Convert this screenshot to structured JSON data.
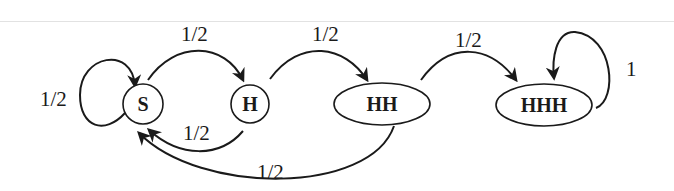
{
  "diagram": {
    "type": "state-transition",
    "nodes": [
      {
        "id": "S",
        "label": "S"
      },
      {
        "id": "H",
        "label": "H"
      },
      {
        "id": "HH",
        "label": "HH"
      },
      {
        "id": "HHH",
        "label": "HHH"
      }
    ],
    "edges": [
      {
        "from": "S",
        "to": "S",
        "label": "1/2"
      },
      {
        "from": "S",
        "to": "H",
        "label": "1/2"
      },
      {
        "from": "H",
        "to": "S",
        "label": "1/2"
      },
      {
        "from": "H",
        "to": "HH",
        "label": "1/2"
      },
      {
        "from": "HH",
        "to": "S",
        "label": "1/2"
      },
      {
        "from": "HH",
        "to": "HHH",
        "label": "1/2"
      },
      {
        "from": "HHH",
        "to": "HHH",
        "label": "1"
      }
    ]
  }
}
